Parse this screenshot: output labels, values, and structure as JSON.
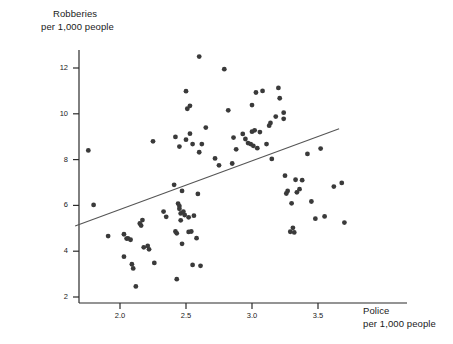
{
  "figure": {
    "background_color": "#ffffff",
    "ink_color": "#2b2b2b",
    "point_color": "#3a3a3a",
    "line_color": "#555555"
  },
  "axes": {
    "y_title_line1": "Robberies",
    "y_title_line2": "per 1,000 people",
    "x_title_line1": "Police",
    "x_title_line2": "per 1,000 people",
    "y_ticks": [
      "2",
      "4",
      "6",
      "8",
      "10",
      "12"
    ],
    "x_ticks": [
      "2.0",
      "2.5",
      "3.0",
      "3.5"
    ]
  },
  "chart_data": {
    "type": "scatter",
    "title": "",
    "xlabel": "Police per 1,000 people",
    "ylabel": "Robberies per 1,000 people",
    "xlim": [
      1.66,
      3.95
    ],
    "ylim": [
      1.85,
      12.95
    ],
    "xticks": [
      2.0,
      2.5,
      3.0,
      3.5
    ],
    "yticks": [
      2,
      4,
      6,
      8,
      10,
      12
    ],
    "grid": false,
    "legend": null,
    "series": [
      {
        "name": "cities",
        "marker": "filled-circle",
        "points": [
          [
            1.76,
            8.4
          ],
          [
            1.8,
            6.02
          ],
          [
            1.91,
            4.66
          ],
          [
            2.03,
            3.76
          ],
          [
            2.03,
            4.74
          ],
          [
            2.05,
            4.55
          ],
          [
            2.06,
            4.56
          ],
          [
            2.08,
            4.5
          ],
          [
            2.09,
            3.43
          ],
          [
            2.1,
            3.25
          ],
          [
            2.12,
            2.46
          ],
          [
            2.15,
            5.21
          ],
          [
            2.16,
            5.12
          ],
          [
            2.17,
            5.36
          ],
          [
            2.18,
            4.17
          ],
          [
            2.21,
            4.23
          ],
          [
            2.22,
            4.08
          ],
          [
            2.25,
            8.8
          ],
          [
            2.26,
            3.49
          ],
          [
            2.33,
            5.73
          ],
          [
            2.35,
            5.5
          ],
          [
            2.41,
            6.9
          ],
          [
            2.42,
            8.99
          ],
          [
            2.42,
            4.86
          ],
          [
            2.43,
            4.78
          ],
          [
            2.43,
            2.78
          ],
          [
            2.44,
            6.08
          ],
          [
            2.45,
            5.85
          ],
          [
            2.45,
            5.97
          ],
          [
            2.45,
            8.57
          ],
          [
            2.46,
            5.35
          ],
          [
            2.46,
            5.65
          ],
          [
            2.47,
            6.63
          ],
          [
            2.47,
            4.32
          ],
          [
            2.48,
            5.73
          ],
          [
            2.49,
            5.58
          ],
          [
            2.5,
            10.99
          ],
          [
            2.5,
            8.87
          ],
          [
            2.51,
            10.22
          ],
          [
            2.52,
            5.48
          ],
          [
            2.52,
            4.84
          ],
          [
            2.53,
            9.13
          ],
          [
            2.53,
            10.35
          ],
          [
            2.54,
            4.86
          ],
          [
            2.55,
            8.68
          ],
          [
            2.55,
            3.4
          ],
          [
            2.56,
            5.55
          ],
          [
            2.58,
            4.57
          ],
          [
            2.59,
            6.5
          ],
          [
            2.6,
            8.32
          ],
          [
            2.6,
            12.5
          ],
          [
            2.61,
            3.36
          ],
          [
            2.62,
            8.68
          ],
          [
            2.65,
            9.4
          ],
          [
            2.72,
            8.05
          ],
          [
            2.75,
            7.75
          ],
          [
            2.79,
            11.95
          ],
          [
            2.82,
            10.15
          ],
          [
            2.85,
            7.83
          ],
          [
            2.86,
            8.96
          ],
          [
            2.88,
            8.45
          ],
          [
            2.93,
            9.12
          ],
          [
            2.95,
            8.9
          ],
          [
            2.97,
            8.72
          ],
          [
            2.99,
            8.68
          ],
          [
            3.0,
            10.38
          ],
          [
            3.0,
            9.22
          ],
          [
            3.01,
            8.6
          ],
          [
            3.02,
            9.28
          ],
          [
            3.03,
            10.93
          ],
          [
            3.04,
            8.5
          ],
          [
            3.06,
            9.2
          ],
          [
            3.08,
            11.0
          ],
          [
            3.11,
            8.68
          ],
          [
            3.13,
            9.48
          ],
          [
            3.14,
            9.6
          ],
          [
            3.15,
            8.03
          ],
          [
            3.18,
            9.88
          ],
          [
            3.2,
            11.13
          ],
          [
            3.21,
            10.68
          ],
          [
            3.24,
            10.05
          ],
          [
            3.24,
            9.78
          ],
          [
            3.25,
            7.3
          ],
          [
            3.26,
            6.52
          ],
          [
            3.27,
            6.63
          ],
          [
            3.29,
            4.85
          ],
          [
            3.3,
            6.09
          ],
          [
            3.31,
            5.02
          ],
          [
            3.32,
            4.82
          ],
          [
            3.33,
            7.12
          ],
          [
            3.34,
            6.57
          ],
          [
            3.36,
            6.71
          ],
          [
            3.38,
            7.1
          ],
          [
            3.42,
            8.25
          ],
          [
            3.45,
            6.17
          ],
          [
            3.48,
            5.42
          ],
          [
            3.52,
            8.48
          ],
          [
            3.55,
            5.52
          ],
          [
            3.62,
            6.82
          ],
          [
            3.68,
            6.98
          ],
          [
            3.7,
            5.25
          ]
        ]
      }
    ],
    "trendline": {
      "name": "regression-line",
      "x_start": 1.66,
      "y_start": 5.1,
      "x_end": 3.66,
      "y_end": 9.35
    }
  }
}
